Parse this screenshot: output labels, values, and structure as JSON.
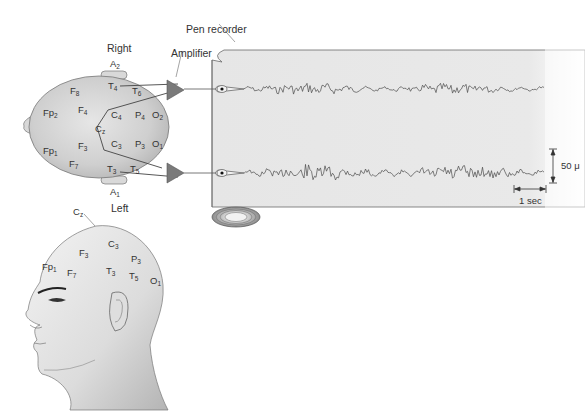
{
  "figure": {
    "type": "EEG recording setup diagram",
    "callouts": {
      "pen_recorder": "Pen recorder",
      "amplifier": "Amplifier",
      "right": "Right",
      "left": "Left"
    },
    "top_view": {
      "ear_electrodes": [
        {
          "base": "A",
          "sub": "2",
          "side": "right"
        },
        {
          "base": "A",
          "sub": "1",
          "side": "left"
        }
      ],
      "electrodes": [
        {
          "base": "F",
          "sub": "8"
        },
        {
          "base": "T",
          "sub": "4"
        },
        {
          "base": "T",
          "sub": "6"
        },
        {
          "base": "Fp",
          "sub": "2"
        },
        {
          "base": "F",
          "sub": "4"
        },
        {
          "base": "C",
          "sub": "4"
        },
        {
          "base": "P",
          "sub": "4"
        },
        {
          "base": "O",
          "sub": "2"
        },
        {
          "base": "C",
          "sub": "z"
        },
        {
          "base": "Fp",
          "sub": "1"
        },
        {
          "base": "F",
          "sub": "3"
        },
        {
          "base": "C",
          "sub": "3"
        },
        {
          "base": "P",
          "sub": "3"
        },
        {
          "base": "O",
          "sub": "1"
        },
        {
          "base": "F",
          "sub": "7"
        },
        {
          "base": "T",
          "sub": "3"
        },
        {
          "base": "T",
          "sub": "5"
        }
      ],
      "channels": [
        {
          "from": "T4",
          "to": "T6",
          "amplifier": "top"
        },
        {
          "from": "T3",
          "to": "T5",
          "amplifier": "bottom"
        }
      ]
    },
    "side_view": {
      "electrodes": [
        {
          "base": "C",
          "sub": "z"
        },
        {
          "base": "F",
          "sub": "3"
        },
        {
          "base": "C",
          "sub": "3"
        },
        {
          "base": "P",
          "sub": "3"
        },
        {
          "base": "Fp",
          "sub": "1"
        },
        {
          "base": "F",
          "sub": "7"
        },
        {
          "base": "T",
          "sub": "3"
        },
        {
          "base": "T",
          "sub": "5"
        },
        {
          "base": "O",
          "sub": "1"
        }
      ]
    },
    "scale": {
      "amplitude": "50 μV",
      "amplitude_visible": "50 μ",
      "time": "1 sec"
    },
    "colors": {
      "head_fill": "#c8c8c8",
      "paper_fill": "#e9e9e9",
      "amplifier_fill": "#7a7a7a",
      "trace": "#4a4a4a",
      "line": "#555555"
    }
  }
}
